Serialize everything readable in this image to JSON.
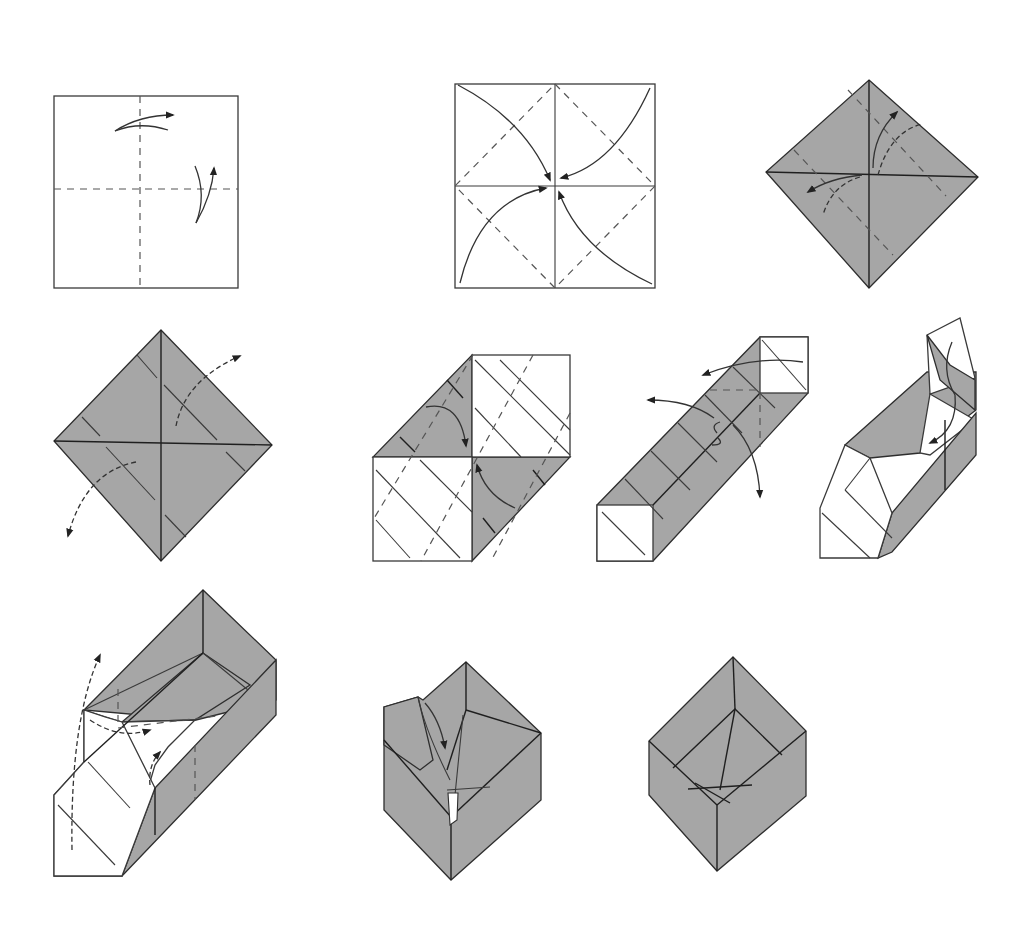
{
  "title": "",
  "colors": {
    "background": "#ffffff",
    "paper_white": "#ffffff",
    "paper_colored": "#a6a6a6",
    "line": "#333333"
  },
  "steps": [
    {
      "id": 1,
      "description": "Square paper, white side up; valley-fold in half both ways and unfold"
    },
    {
      "id": 2,
      "description": "Fold all four corners to the center (blintz)"
    },
    {
      "id": 3,
      "description": "Blintzed square turned as diamond (colored side); fold flaps and unfold"
    },
    {
      "id": 4,
      "description": "Diamond with crease lines; unfold opposite flaps"
    },
    {
      "id": 5,
      "description": "Collapse along the creases into a strip"
    },
    {
      "id": 6,
      "description": "Long strip; raise the sides"
    },
    {
      "id": 7,
      "description": "Raise the walls and tuck the end"
    },
    {
      "id": 8,
      "description": "Form the box walls; fold in the end flap"
    },
    {
      "id": 9,
      "description": "Lock the last corner"
    },
    {
      "id": 10,
      "description": "Finished box"
    }
  ]
}
